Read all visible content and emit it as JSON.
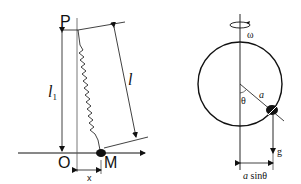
{
  "left_figure": {
    "label_P": "P",
    "label_O": "O",
    "label_M": "M",
    "label_l1": "l",
    "label_l1_sub": "1",
    "label_l": "l",
    "label_x": "x"
  },
  "right_figure": {
    "label_omega": "ω",
    "label_theta": "θ",
    "label_a": "a",
    "label_g": "g",
    "label_asin_a": "a",
    "label_asin_rest": " sinθ"
  },
  "colors": {
    "stroke": "#111111",
    "background": "#ffffff"
  }
}
